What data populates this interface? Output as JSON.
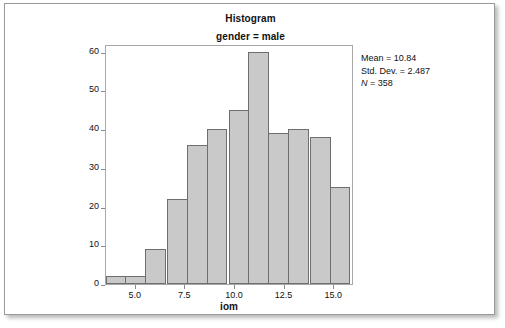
{
  "figure": {
    "title": "Histogram",
    "subtitle": "gender = male"
  },
  "stats": {
    "mean_label": "Mean = 10.84",
    "std_dev_label": "Std. Dev. = 2.487",
    "n_symbol": "N",
    "n_value": " = 358"
  },
  "colors": {
    "bar_fill": "#c9c9c9",
    "bar_edge": "#6e6e6e",
    "plot_border": "#a8a8a8",
    "frame_border": "#9a9a9a",
    "text": "#111111"
  },
  "chart_data": {
    "type": "bar",
    "title": "Histogram",
    "subtitle": "gender = male",
    "xlabel": "iom",
    "ylabel": "Frequency",
    "xlim": [
      3.5,
      16.0
    ],
    "ylim": [
      0,
      62
    ],
    "grid": false,
    "legend": null,
    "bin_width": 1.0417,
    "x_ticks": [
      5.0,
      7.5,
      10.0,
      12.5,
      15.0
    ],
    "x_tick_labels": [
      "5.0",
      "7.5",
      "10.0",
      "12.5",
      "15.0"
    ],
    "y_ticks": [
      0,
      10,
      20,
      30,
      40,
      50,
      60
    ],
    "y_tick_labels": [
      "0",
      "10",
      "20",
      "30",
      "40",
      "50",
      "60"
    ],
    "bin_centers": [
      4.0,
      5.0,
      6.0,
      7.1,
      8.1,
      9.1,
      10.2,
      11.2,
      12.2,
      13.2,
      14.3,
      15.3
    ],
    "values": [
      2,
      2,
      9,
      22,
      36,
      40,
      45,
      60,
      39,
      40,
      38,
      25
    ],
    "annotations": [
      "Mean = 10.84",
      "Std. Dev. = 2.487",
      "N = 358"
    ]
  }
}
